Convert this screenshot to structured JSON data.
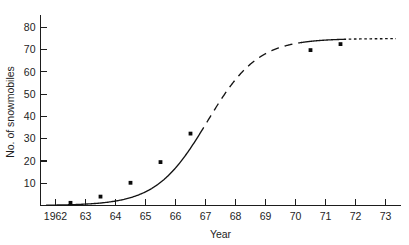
{
  "chart_data": {
    "type": "line",
    "title": "",
    "xlabel": "Year",
    "ylabel": "No. of snowmobiles",
    "xlim": [
      1961.5,
      1973.5
    ],
    "ylim": [
      0,
      84
    ],
    "grid": false,
    "legend": null,
    "x_tick_labels": [
      "1962",
      "63",
      "64",
      "65",
      "66",
      "67",
      "68",
      "69",
      "70",
      "71",
      "72",
      "73"
    ],
    "x_tick_values": [
      1962,
      1963,
      1964,
      1965,
      1966,
      1967,
      1968,
      1969,
      1970,
      1971,
      1972,
      1973
    ],
    "y_tick_labels": [
      "10",
      "20",
      "30",
      "40",
      "50",
      "60",
      "70",
      "80"
    ],
    "y_tick_values": [
      10,
      20,
      30,
      40,
      50,
      60,
      70,
      80
    ],
    "series": [
      {
        "name": "No. of snowmobiles",
        "marker": "filled-square",
        "x": [
          1962.5,
          1963.5,
          1964.5,
          1965.5,
          1966.5,
          1970.5,
          1971.5
        ],
        "values": [
          1.2,
          4.0,
          10.2,
          19.5,
          32.3,
          69.8,
          72.5
        ]
      }
    ],
    "curve_segments": [
      {
        "style": "solid",
        "x_from": 1961.7,
        "x_to": 1966.8
      },
      {
        "style": "dashed",
        "x_from": 1966.8,
        "x_to": 1970.2
      },
      {
        "style": "solid",
        "x_from": 1970.2,
        "x_to": 1971.6
      },
      {
        "style": "dotted",
        "x_from": 1971.6,
        "x_to": 1973.35
      }
    ],
    "annotations": []
  },
  "axis": {
    "x_title": "Year",
    "y_title": "No. of snowmobiles"
  }
}
